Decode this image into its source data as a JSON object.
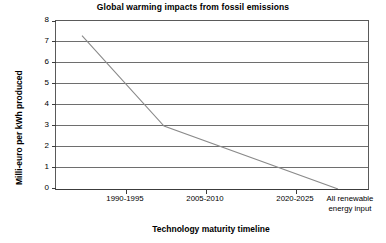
{
  "chart_data": {
    "type": "line",
    "title": "Global warming impacts from fossil emissions",
    "xlabel": "Technology maturity timeline",
    "ylabel": "Milli-euro per kWh produced",
    "categories": [
      "1990-1995",
      "2005-2010",
      "2020-2025",
      "All renewable energy input"
    ],
    "category_labels_wrapped": [
      [
        "1990-1995"
      ],
      [
        "2005-2010"
      ],
      [
        "2020-2025"
      ],
      [
        "All renewable",
        "energy input"
      ]
    ],
    "x": [
      125,
      205,
      295,
      337
    ],
    "values": [
      5.6,
      3.0,
      0.55,
      0.0
    ],
    "line_start": {
      "x_px": 81,
      "value": 7.3
    },
    "line_end": {
      "x_px": 337,
      "value": 0.0
    },
    "vertices": [
      {
        "x_px": 81,
        "value": 7.3
      },
      {
        "x_px": 163,
        "value": 3.0
      },
      {
        "x_px": 337,
        "value": 0.0
      }
    ],
    "ylim": [
      0,
      8
    ],
    "ytick_labels": [
      "8",
      "7",
      "6",
      "5",
      "4",
      "3",
      "2",
      "1",
      "0"
    ],
    "ytick_values": [
      8,
      7,
      6,
      5,
      4,
      3,
      2,
      1,
      0
    ],
    "grid": true,
    "legend": false,
    "series": [
      {
        "name": "Global warming impact",
        "values": [
          7.3,
          3.0,
          0.55,
          0.0
        ],
        "color": "#808080"
      }
    ],
    "colors": {
      "line": "#8a8a8a",
      "grid": "#6e6e6e",
      "axis": "#3c3c3c",
      "background": "#ffffff",
      "text": "#000000"
    }
  }
}
